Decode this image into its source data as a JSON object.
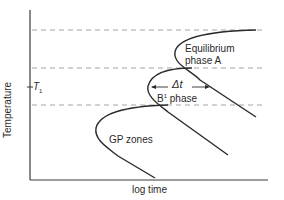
{
  "diagram": {
    "title": "",
    "x_axis": {
      "label": "log time"
    },
    "y_axis": {
      "label": "Temperature",
      "marker_label": "T",
      "marker_subscript": "1"
    },
    "curves": [
      {
        "id": "equilibrium",
        "label_line1": "Equilibrium",
        "label_line2": "phase A"
      },
      {
        "id": "b-prime",
        "label": "B",
        "label_sup": "1",
        "label_suffix": " phase"
      },
      {
        "id": "gp-zones",
        "label": "GP zones"
      }
    ],
    "annotation": {
      "label": "Δt",
      "meaning": "time difference at T1 between curves"
    },
    "dashed_levels": 3,
    "colors": {
      "line": "#2a2a2a",
      "dashed": "#9a9a9a",
      "background": "#ffffff"
    }
  }
}
